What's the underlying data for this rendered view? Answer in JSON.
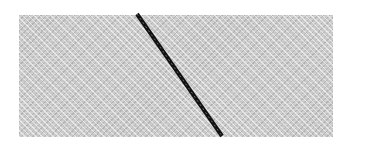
{
  "scene": {
    "background_color": "#ffffff",
    "panel": {
      "fill_color": "#c9c9c9",
      "pattern": "diagonal-weave"
    },
    "line": {
      "color": "#111111",
      "style": "zigzag-stitch",
      "start": [
        137,
        14
      ],
      "end": [
        222,
        136
      ]
    }
  }
}
